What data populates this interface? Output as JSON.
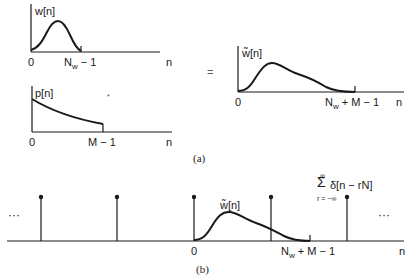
{
  "figure": {
    "panel_a": {
      "caption": "(a)",
      "operator_convolve": "*",
      "operator_equals": "=",
      "plot_w": {
        "ylabel": "w[n]",
        "xlabel": "n",
        "tick_start": "0",
        "tick_end_main": "N",
        "tick_end_sub": "w",
        "tick_end_rest": " − 1",
        "shape": "bell-shaped window from 0 to Nw−1"
      },
      "plot_p": {
        "ylabel": "p[n]",
        "xlabel": "n",
        "tick_start": "0",
        "tick_end": "M − 1",
        "shape": "decaying exponential from 0 to M−1"
      },
      "plot_wtilde": {
        "ylabel": "w̃[n]",
        "xlabel": "n",
        "tick_start": "0",
        "tick_end_main": "N",
        "tick_end_sub": "w",
        "tick_end_rest": " + M − 1",
        "shape": "skewed smooth window from 0 to Nw+M−1"
      }
    },
    "panel_b": {
      "caption": "(b)",
      "ellipsis_left": "···",
      "ellipsis_right": "···",
      "curve_label": "w̃[n]",
      "tick_start": "0",
      "tick_end_main": "N",
      "tick_end_sub": "w",
      "tick_end_rest": " + M − 1",
      "xlabel": "n",
      "sum_symbol": "Σ",
      "sum_upper": "∞",
      "sum_lower": "r = −∞",
      "sum_term": "δ[n − rN]",
      "impulse_positions_px": [
        41,
        117,
        194,
        271,
        347
      ]
    }
  }
}
